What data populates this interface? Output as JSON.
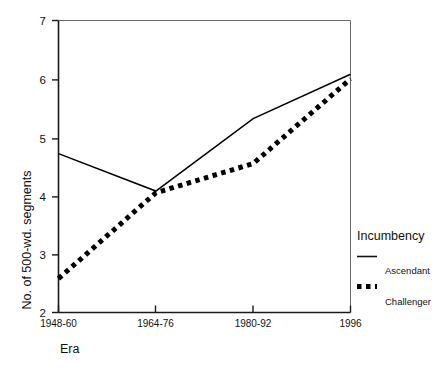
{
  "chart_data": {
    "type": "line",
    "title": "",
    "xlabel": "Era",
    "ylabel": "No. of 500-wd. segments",
    "categories": [
      "1948-60",
      "1964-76",
      "1980-92",
      "1996"
    ],
    "ylim": [
      2,
      7
    ],
    "yticks": [
      2,
      3,
      4,
      5,
      6,
      7
    ],
    "ytick_labels": [
      "2",
      "3",
      "4",
      "5",
      "6",
      "7"
    ],
    "grid": false,
    "legend_position": "right",
    "legend_title": "Incumbency",
    "series": [
      {
        "name": "Ascendant",
        "style": "solid",
        "color": "#000000",
        "values": [
          4.72,
          4.08,
          5.32,
          6.08
        ]
      },
      {
        "name": "Challenger",
        "style": "dotted",
        "color": "#000000",
        "values": [
          2.58,
          4.05,
          4.55,
          6.0
        ]
      }
    ]
  },
  "axes": {
    "x_tick_labels": [
      "1948-60",
      "1964-76",
      "1980-92",
      "1996"
    ],
    "y_tick_labels": [
      "7",
      "6",
      "5",
      "4",
      "3",
      "2"
    ],
    "x_axis_title": "Era",
    "y_axis_title": "No. of 500-wd. segments"
  },
  "legend": {
    "title": "Incumbency",
    "items": [
      {
        "label": "Ascendant",
        "style": "solid"
      },
      {
        "label": "Challenger",
        "style": "dotted"
      }
    ]
  }
}
